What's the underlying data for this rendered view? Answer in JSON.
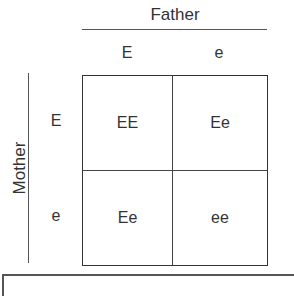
{
  "diagram": {
    "type": "punnett-square",
    "parent_top": {
      "label": "Father",
      "alleles": [
        "E",
        "e"
      ]
    },
    "parent_side": {
      "label": "Mother",
      "alleles": [
        "E",
        "e"
      ]
    },
    "cells": [
      [
        "EE",
        "Ee"
      ],
      [
        "Ee",
        "ee"
      ]
    ]
  }
}
